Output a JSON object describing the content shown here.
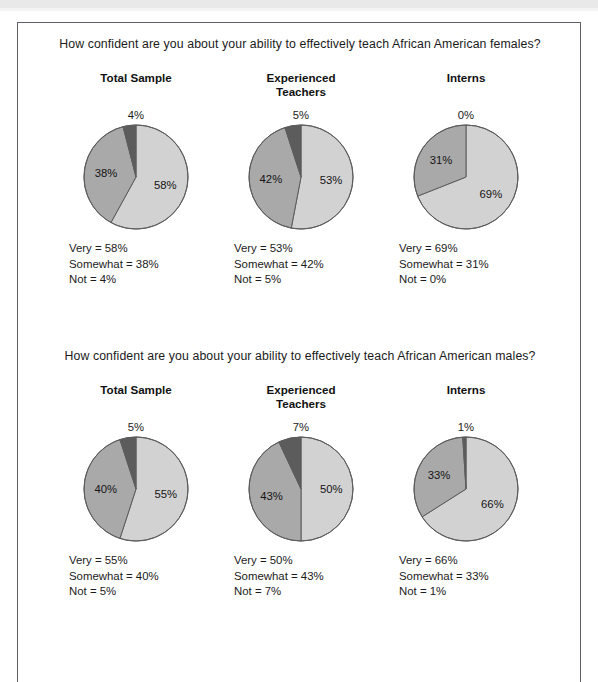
{
  "figure": {
    "colors": {
      "slice_very": "#d2d2d2",
      "slice_somewhat": "#a9a9a9",
      "slice_not": "#5c5c5c",
      "slice_outline": "#5c5c5c",
      "frame_border": "#5e6066",
      "text": "#1b1b1b",
      "background": "#ffffff"
    },
    "group_headers": [
      {
        "line1": "Total Sample",
        "line2": ""
      },
      {
        "line1": "Experienced",
        "line2": "Teachers"
      },
      {
        "line1": "Interns",
        "line2": ""
      }
    ],
    "legend_keys": {
      "very": "Very",
      "somewhat": "Somewhat",
      "not": "Not"
    }
  },
  "chart_data": [
    {
      "type": "pie",
      "title": "How confident are you about your ability to effectively teach African American females?",
      "group": "Total Sample",
      "labels": [
        "Very",
        "Somewhat",
        "Not"
      ],
      "values": [
        58,
        38,
        4
      ],
      "value_labels": [
        "58%",
        "38%",
        "4%"
      ],
      "top_label": "4%",
      "legend": [
        "Very = 58%",
        "Somewhat = 38%",
        "Not = 4%"
      ]
    },
    {
      "type": "pie",
      "title": "How confident are you about your ability to effectively teach African American females?",
      "group": "Experienced Teachers",
      "labels": [
        "Very",
        "Somewhat",
        "Not"
      ],
      "values": [
        53,
        42,
        5
      ],
      "value_labels": [
        "53%",
        "42%",
        "5%"
      ],
      "top_label": "5%",
      "legend": [
        "Very = 53%",
        "Somewhat = 42%",
        "Not = 5%"
      ]
    },
    {
      "type": "pie",
      "title": "How confident are you about your ability to effectively teach African American females?",
      "group": "Interns",
      "labels": [
        "Very",
        "Somewhat",
        "Not"
      ],
      "values": [
        69,
        31,
        0
      ],
      "value_labels": [
        "69%",
        "31%",
        "0%"
      ],
      "top_label": "0%",
      "legend": [
        "Very = 69%",
        "Somewhat = 31%",
        "Not = 0%"
      ]
    },
    {
      "type": "pie",
      "title": "How confident are you about your ability to effectively teach African American males?",
      "group": "Total Sample",
      "labels": [
        "Very",
        "Somewhat",
        "Not"
      ],
      "values": [
        55,
        40,
        5
      ],
      "value_labels": [
        "55%",
        "40%",
        "5%"
      ],
      "top_label": "5%",
      "legend": [
        "Very = 55%",
        "Somewhat = 40%",
        "Not = 5%"
      ]
    },
    {
      "type": "pie",
      "title": "How confident are you about your ability to effectively teach African American males?",
      "group": "Experienced Teachers",
      "labels": [
        "Very",
        "Somewhat",
        "Not"
      ],
      "values": [
        50,
        43,
        7
      ],
      "value_labels": [
        "50%",
        "43%",
        "7%"
      ],
      "top_label": "7%",
      "legend": [
        "Very = 50%",
        "Somewhat = 43%",
        "Not = 7%"
      ]
    },
    {
      "type": "pie",
      "title": "How confident are you about your ability to effectively teach African American males?",
      "group": "Interns",
      "labels": [
        "Very",
        "Somewhat",
        "Not"
      ],
      "values": [
        66,
        33,
        1
      ],
      "value_labels": [
        "66%",
        "33%",
        "1%"
      ],
      "top_label": "1%",
      "legend": [
        "Very = 66%",
        "Somewhat = 33%",
        "Not = 1%"
      ]
    }
  ],
  "questions": [
    {
      "text": "How confident are you about your ability to effectively teach African American females?"
    },
    {
      "text": "How confident are you about your ability to effectively teach African American males?"
    }
  ]
}
